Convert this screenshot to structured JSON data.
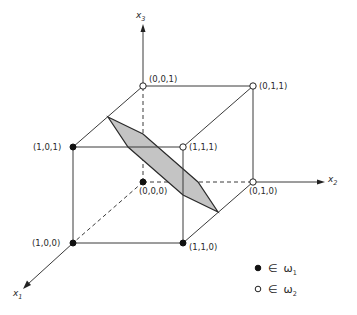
{
  "diagram": {
    "type": "3d-unit-cube-with-separating-plane",
    "axes": [
      {
        "name": "x1",
        "label": "x",
        "sub": "1"
      },
      {
        "name": "x2",
        "label": "x",
        "sub": "2"
      },
      {
        "name": "x3",
        "label": "x",
        "sub": "3"
      }
    ],
    "vertices": [
      {
        "id": "v001",
        "label": "(0,0,1)",
        "class": "omega2",
        "filled": false
      },
      {
        "id": "v011",
        "label": "(0,1,1)",
        "class": "omega2",
        "filled": false
      },
      {
        "id": "v101",
        "label": "(1,0,1)",
        "class": "omega1",
        "filled": true
      },
      {
        "id": "v111",
        "label": "(1,1,1)",
        "class": "omega2",
        "filled": false
      },
      {
        "id": "v000",
        "label": "(0,0,0)",
        "class": "omega1",
        "filled": true
      },
      {
        "id": "v010",
        "label": "(0,1,0)",
        "class": "omega2",
        "filled": false
      },
      {
        "id": "v100",
        "label": "(1,0,0)",
        "class": "omega1",
        "filled": true
      },
      {
        "id": "v110",
        "label": "(1,1,0)",
        "class": "omega1",
        "filled": true
      }
    ],
    "separating_plane": {
      "shape": "hexagon",
      "fill": "#c4c4c4"
    },
    "legend": [
      {
        "marker": "filled-dot",
        "symbol": "∈",
        "label": "ω",
        "sub": "1"
      },
      {
        "marker": "open-dot",
        "symbol": "∈",
        "label": "ω",
        "sub": "2"
      }
    ]
  }
}
